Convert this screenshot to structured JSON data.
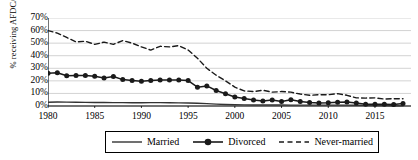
{
  "chart_data": {
    "type": "line",
    "title": "",
    "xlabel": "",
    "ylabel": "% receiving AFDC/TANF",
    "xlim": [
      1980,
      2018
    ],
    "ylim": [
      0,
      70
    ],
    "grid": true,
    "legend_position": "bottom",
    "y_ticks": [
      "0%",
      "10%",
      "20%",
      "30%",
      "40%",
      "50%",
      "60%",
      "70%"
    ],
    "y_tick_values": [
      0,
      10,
      20,
      30,
      40,
      50,
      60,
      70
    ],
    "x_ticks": [
      "1980",
      "1985",
      "1990",
      "1995",
      "2000",
      "2005",
      "2010",
      "2015"
    ],
    "x_tick_values": [
      1980,
      1985,
      1990,
      1995,
      2000,
      2005,
      2010,
      2015
    ],
    "x": [
      1980,
      1981,
      1982,
      1983,
      1984,
      1985,
      1986,
      1987,
      1988,
      1989,
      1990,
      1991,
      1992,
      1993,
      1994,
      1995,
      1996,
      1997,
      1998,
      1999,
      2000,
      2001,
      2002,
      2003,
      2004,
      2005,
      2006,
      2007,
      2008,
      2009,
      2010,
      2011,
      2012,
      2013,
      2014,
      2015,
      2016,
      2017,
      2018
    ],
    "series": [
      {
        "name": "Married",
        "style": "solid",
        "marker": "none",
        "color": "#333333",
        "values": [
          3.0,
          3.2,
          3.1,
          3.0,
          2.9,
          2.8,
          2.8,
          2.7,
          2.7,
          2.6,
          2.6,
          2.7,
          2.7,
          2.6,
          2.5,
          2.4,
          2.2,
          1.9,
          1.5,
          1.2,
          1.0,
          0.9,
          0.8,
          0.8,
          0.8,
          0.8,
          0.7,
          0.7,
          0.7,
          0.7,
          0.7,
          0.7,
          0.7,
          0.6,
          0.5,
          0.4,
          0.3,
          0.2,
          0.1
        ]
      },
      {
        "name": "Divorced",
        "style": "solid",
        "marker": "circle",
        "color": "#1a1a1a",
        "values": [
          26.0,
          26.4,
          24.0,
          24.2,
          24.3,
          23.6,
          22.2,
          23.5,
          21.0,
          20.3,
          19.6,
          20.3,
          20.6,
          20.7,
          20.6,
          20.2,
          15.0,
          16.0,
          12.3,
          9.7,
          7.1,
          6.0,
          4.8,
          3.9,
          4.7,
          3.5,
          5.0,
          3.5,
          2.7,
          2.4,
          2.5,
          2.9,
          3.2,
          2.3,
          1.4,
          1.3,
          1.3,
          1.2,
          1.9
        ]
      },
      {
        "name": "Never-married",
        "style": "dashed",
        "marker": "none",
        "color": "#1a1a1a",
        "values": [
          60.0,
          58.0,
          54.5,
          51.0,
          51.5,
          49.0,
          50.8,
          49.0,
          52.0,
          50.0,
          47.0,
          44.5,
          47.5,
          47.0,
          48.0,
          44.5,
          38.0,
          30.0,
          24.5,
          20.0,
          15.0,
          12.0,
          11.5,
          12.5,
          11.0,
          11.5,
          11.0,
          9.5,
          8.5,
          9.0,
          9.0,
          9.8,
          8.5,
          6.5,
          6.3,
          6.5,
          5.5,
          5.8,
          5.8
        ]
      }
    ]
  },
  "legend": {
    "items": [
      {
        "label": "Married"
      },
      {
        "label": "Divorced"
      },
      {
        "label": "Never-married"
      }
    ]
  }
}
